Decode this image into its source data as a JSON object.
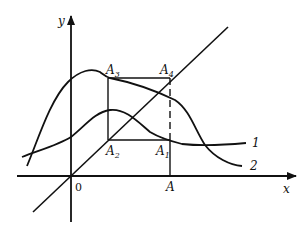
{
  "diagram": {
    "title": "",
    "axes": {
      "x_label": "x",
      "y_label": "y",
      "origin_label": "0",
      "x_tick_label": "A"
    },
    "points": {
      "A1": {
        "name": "A",
        "sub": "1"
      },
      "A2": {
        "name": "A",
        "sub": "2"
      },
      "A3": {
        "name": "A",
        "sub": "3"
      },
      "A4": {
        "name": "A",
        "sub": "4"
      }
    },
    "curves": [
      {
        "id": "curve-1",
        "label": "1",
        "description": "lower hump curve flattening to a horizontal asymptote"
      },
      {
        "id": "curve-2",
        "label": "2",
        "description": "taller hump curve decaying toward the x-axis"
      },
      {
        "id": "bisector",
        "label": "",
        "description": "straight line y = x through the origin"
      }
    ],
    "colors": {
      "stroke": "#111111",
      "background": "#ffffff"
    }
  }
}
